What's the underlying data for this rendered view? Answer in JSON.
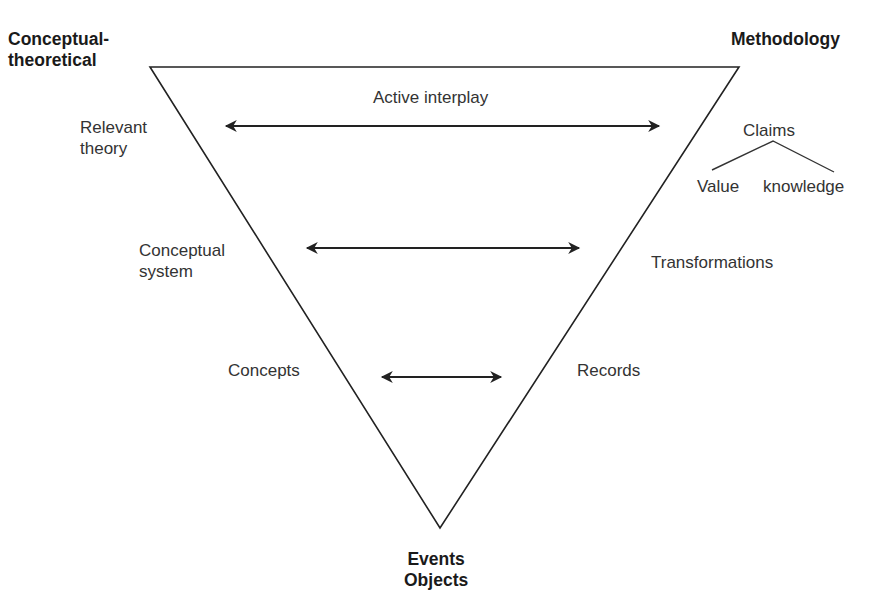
{
  "corners": {
    "top_left": [
      "Conceptual-",
      "theoretical"
    ],
    "top_right": "Methodology",
    "bottom": [
      "Events",
      "Objects"
    ]
  },
  "levels": [
    {
      "left": [
        "Relevant",
        "theory"
      ],
      "arrow_label": "Active interplay",
      "right": "Claims"
    },
    {
      "left": [
        "Conceptual",
        "system"
      ],
      "right": "Transformations"
    },
    {
      "left": [
        "Concepts"
      ],
      "right": "Records"
    }
  ],
  "claims_branches": [
    "Value",
    "knowledge"
  ],
  "colors": {
    "line": "#222222",
    "text": "#333333",
    "background": "#ffffff"
  },
  "geometry": {
    "triangle": [
      [
        150,
        67
      ],
      [
        739,
        67
      ],
      [
        440,
        528
      ]
    ],
    "arrows": [
      {
        "x1": 224,
        "x2": 661,
        "y": 126
      },
      {
        "x1": 305,
        "x2": 581,
        "y": 248
      },
      {
        "x1": 380,
        "x2": 503,
        "y": 377
      }
    ]
  }
}
